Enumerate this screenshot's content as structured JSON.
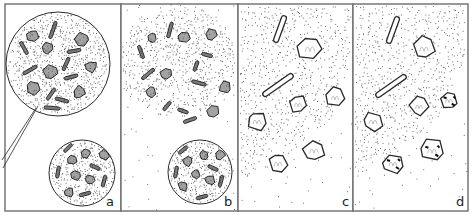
{
  "figure": {
    "width": 472,
    "height": 215,
    "colors": {
      "ink": "#2a2a2a",
      "frame": "#6d6d6d",
      "bg": "#ffffff",
      "stipple": "#3a3a3a"
    },
    "panels": [
      {
        "label": "a",
        "x": 5,
        "y": 4,
        "w": 116,
        "h": 207,
        "circles": [
          {
            "cx": 58,
            "cy": 64,
            "r": 52,
            "density": 0.55
          },
          {
            "cx": 82,
            "cy": 173,
            "r": 33,
            "density": 0.55
          }
        ],
        "pointer": [
          [
            38,
            106
          ],
          [
            3,
            168
          ],
          [
            36,
            108
          ],
          [
            2,
            160
          ]
        ],
        "crystals": [
          {
            "t": "poly",
            "cx": 33,
            "cy": 36,
            "s": 6
          },
          {
            "t": "poly",
            "cx": 82,
            "cy": 39,
            "s": 7
          },
          {
            "t": "poly",
            "cx": 47,
            "cy": 48,
            "s": 6
          },
          {
            "t": "poly",
            "cx": 50,
            "cy": 72,
            "s": 7
          },
          {
            "t": "poly",
            "cx": 91,
            "cy": 67,
            "s": 6
          },
          {
            "t": "poly",
            "cx": 33,
            "cy": 88,
            "s": 7
          },
          {
            "t": "poly",
            "cx": 79,
            "cy": 92,
            "s": 6
          },
          {
            "t": "rod",
            "cx": 53,
            "cy": 30,
            "l": 18,
            "a": -70
          },
          {
            "t": "rod",
            "cx": 24,
            "cy": 48,
            "l": 14,
            "a": 60
          },
          {
            "t": "rod",
            "cx": 74,
            "cy": 51,
            "l": 14,
            "a": -10
          },
          {
            "t": "rod",
            "cx": 66,
            "cy": 64,
            "l": 14,
            "a": -65
          },
          {
            "t": "rod",
            "cx": 30,
            "cy": 70,
            "l": 16,
            "a": -30
          },
          {
            "t": "rod",
            "cx": 71,
            "cy": 77,
            "l": 14,
            "a": -15
          },
          {
            "t": "rod",
            "cx": 51,
            "cy": 94,
            "l": 14,
            "a": -55
          },
          {
            "t": "rod",
            "cx": 62,
            "cy": 100,
            "l": 14,
            "a": 15
          },
          {
            "t": "rod",
            "cx": 52,
            "cy": 108,
            "l": 16,
            "a": 5
          },
          {
            "t": "poly",
            "cx": 86,
            "cy": 153,
            "s": 5
          },
          {
            "t": "poly",
            "cx": 72,
            "cy": 160,
            "s": 5
          },
          {
            "t": "poly",
            "cx": 104,
            "cy": 155,
            "s": 5
          },
          {
            "t": "poly",
            "cx": 76,
            "cy": 175,
            "s": 5
          },
          {
            "t": "poly",
            "cx": 90,
            "cy": 180,
            "s": 5
          },
          {
            "t": "poly",
            "cx": 69,
            "cy": 192,
            "s": 5
          },
          {
            "t": "rod",
            "cx": 68,
            "cy": 148,
            "l": 11,
            "a": -45
          },
          {
            "t": "rod",
            "cx": 95,
            "cy": 167,
            "l": 11,
            "a": 25
          },
          {
            "t": "rod",
            "cx": 58,
            "cy": 172,
            "l": 12,
            "a": -80
          },
          {
            "t": "rod",
            "cx": 104,
            "cy": 181,
            "l": 12,
            "a": -75
          },
          {
            "t": "rod",
            "cx": 85,
            "cy": 194,
            "l": 12,
            "a": -15
          }
        ]
      },
      {
        "label": "b",
        "x": 121,
        "y": 4,
        "w": 117,
        "h": 207,
        "cloud": {
          "cx": 178,
          "cy": 62,
          "rx": 62,
          "ry": 60,
          "density": 0.42
        },
        "circles": [
          {
            "cx": 200,
            "cy": 172,
            "r": 32,
            "density": 0.55
          }
        ],
        "crystals": [
          {
            "t": "poly",
            "cx": 152,
            "cy": 38,
            "s": 5
          },
          {
            "t": "poly",
            "cx": 184,
            "cy": 37,
            "s": 6
          },
          {
            "t": "poly",
            "cx": 211,
            "cy": 35,
            "s": 6
          },
          {
            "t": "poly",
            "cx": 166,
            "cy": 74,
            "s": 6
          },
          {
            "t": "poly",
            "cx": 151,
            "cy": 92,
            "s": 6
          },
          {
            "t": "poly",
            "cx": 225,
            "cy": 87,
            "s": 6
          },
          {
            "t": "poly",
            "cx": 213,
            "cy": 111,
            "s": 6
          },
          {
            "t": "rod",
            "cx": 170,
            "cy": 30,
            "l": 16,
            "a": -75
          },
          {
            "t": "rod",
            "cx": 141,
            "cy": 52,
            "l": 14,
            "a": 70
          },
          {
            "t": "rod",
            "cx": 207,
            "cy": 55,
            "l": 11,
            "a": 15
          },
          {
            "t": "rod",
            "cx": 196,
            "cy": 66,
            "l": 11,
            "a": -70
          },
          {
            "t": "rod",
            "cx": 148,
            "cy": 74,
            "l": 16,
            "a": -40
          },
          {
            "t": "rod",
            "cx": 199,
            "cy": 83,
            "l": 15,
            "a": 15
          },
          {
            "t": "rod",
            "cx": 167,
            "cy": 106,
            "l": 11,
            "a": -50
          },
          {
            "t": "rod",
            "cx": 183,
            "cy": 111,
            "l": 11,
            "a": 20
          },
          {
            "t": "rod",
            "cx": 190,
            "cy": 120,
            "l": 14,
            "a": -20
          },
          {
            "t": "poly",
            "cx": 204,
            "cy": 155,
            "s": 5
          },
          {
            "t": "poly",
            "cx": 188,
            "cy": 161,
            "s": 5
          },
          {
            "t": "poly",
            "cx": 220,
            "cy": 155,
            "s": 5
          },
          {
            "t": "poly",
            "cx": 196,
            "cy": 174,
            "s": 5
          },
          {
            "t": "poly",
            "cx": 210,
            "cy": 180,
            "s": 5
          },
          {
            "t": "poly",
            "cx": 183,
            "cy": 186,
            "s": 5
          },
          {
            "t": "rod",
            "cx": 183,
            "cy": 150,
            "l": 11,
            "a": -40
          },
          {
            "t": "rod",
            "cx": 213,
            "cy": 168,
            "l": 11,
            "a": 25
          },
          {
            "t": "rod",
            "cx": 176,
            "cy": 172,
            "l": 12,
            "a": -80
          },
          {
            "t": "rod",
            "cx": 221,
            "cy": 181,
            "l": 12,
            "a": -75
          },
          {
            "t": "rod",
            "cx": 202,
            "cy": 197,
            "l": 12,
            "a": -15
          }
        ]
      },
      {
        "label": "c",
        "x": 238,
        "y": 4,
        "w": 115,
        "h": 207,
        "wedge": [
          [
            240,
            6
          ],
          [
            350,
            6
          ],
          [
            350,
            60
          ],
          [
            330,
            120
          ],
          [
            280,
            160
          ],
          [
            240,
            180
          ]
        ],
        "outlined": [
          {
            "t": "rod",
            "cx": 280,
            "cy": 29,
            "l": 28,
            "a": -70
          },
          {
            "t": "poly",
            "cx": 310,
            "cy": 48,
            "s": 12
          },
          {
            "t": "rod",
            "cx": 278,
            "cy": 85,
            "l": 36,
            "a": -35
          },
          {
            "t": "poly",
            "cx": 298,
            "cy": 104,
            "s": 9
          },
          {
            "t": "poly",
            "cx": 335,
            "cy": 97,
            "s": 9
          },
          {
            "t": "poly",
            "cx": 257,
            "cy": 121,
            "s": 10
          },
          {
            "t": "poly",
            "cx": 314,
            "cy": 150,
            "s": 11
          },
          {
            "t": "poly",
            "cx": 278,
            "cy": 163,
            "s": 10
          }
        ]
      },
      {
        "label": "d",
        "x": 353,
        "y": 4,
        "w": 115,
        "h": 207,
        "wedge": [
          [
            355,
            6
          ],
          [
            465,
            6
          ],
          [
            465,
            55
          ],
          [
            440,
            115
          ],
          [
            400,
            150
          ],
          [
            355,
            178
          ]
        ],
        "outlined": [
          {
            "t": "rod",
            "cx": 393,
            "cy": 30,
            "l": 28,
            "a": -70
          },
          {
            "t": "poly",
            "cx": 424,
            "cy": 48,
            "s": 11
          },
          {
            "t": "rod",
            "cx": 391,
            "cy": 86,
            "l": 36,
            "a": -35
          },
          {
            "t": "poly",
            "cx": 419,
            "cy": 106,
            "s": 9
          },
          {
            "t": "poly",
            "cx": 449,
            "cy": 100,
            "s": 9,
            "dark": true
          },
          {
            "t": "poly",
            "cx": 373,
            "cy": 121,
            "s": 10
          },
          {
            "t": "poly",
            "cx": 432,
            "cy": 150,
            "s": 11,
            "dark": true
          },
          {
            "t": "poly",
            "cx": 393,
            "cy": 163,
            "s": 10,
            "dark": true
          }
        ]
      }
    ]
  }
}
